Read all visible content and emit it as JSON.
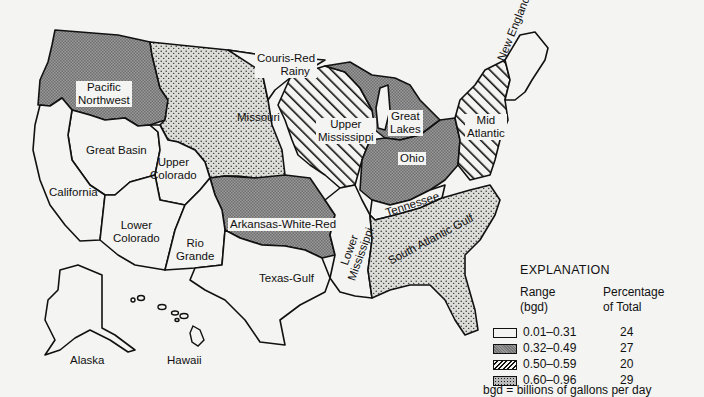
{
  "map": {
    "title": "Water Resources Regions of the United States",
    "regions": [
      {
        "name": "Pacific Northwest",
        "class": "0.32-0.49"
      },
      {
        "name": "Great Basin",
        "class": "0.01-0.31"
      },
      {
        "name": "California",
        "class": "0.01-0.31"
      },
      {
        "name": "Upper Colorado",
        "class": "0.01-0.31"
      },
      {
        "name": "Lower Colorado",
        "class": "0.01-0.31"
      },
      {
        "name": "Rio Grande",
        "class": "0.01-0.31"
      },
      {
        "name": "Texas-Gulf",
        "class": "0.01-0.31"
      },
      {
        "name": "Missouri",
        "class": "0.60-0.96"
      },
      {
        "name": "Couris-Red Rainy",
        "class": "0.01-0.31"
      },
      {
        "name": "Upper Mississippi",
        "class": "0.50-0.59"
      },
      {
        "name": "Great Lakes",
        "class": "0.32-0.49"
      },
      {
        "name": "Ohio",
        "class": "0.32-0.49"
      },
      {
        "name": "Mid Atlantic",
        "class": "0.50-0.59"
      },
      {
        "name": "New England",
        "class": "0.01-0.31"
      },
      {
        "name": "Arkansas-White-Red",
        "class": "0.32-0.49"
      },
      {
        "name": "Lower Mississippi",
        "class": "0.01-0.31"
      },
      {
        "name": "Tennessee",
        "class": "0.01-0.31"
      },
      {
        "name": "South Atlantic Gulf",
        "class": "0.60-0.96"
      },
      {
        "name": "Alaska",
        "class": "0.01-0.31"
      },
      {
        "name": "Hawaii",
        "class": "0.01-0.31"
      }
    ],
    "labels": {
      "pacific_nw_1": "Pacific",
      "pacific_nw_2": "Northwest",
      "great_basin": "Great Basin",
      "california": "California",
      "upper_colorado_1": "Upper",
      "upper_colorado_2": "Colorado",
      "lower_colorado_1": "Lower",
      "lower_colorado_2": "Colorado",
      "rio_grande_1": "Rio",
      "rio_grande_2": "Grande",
      "texas_gulf": "Texas-Gulf",
      "missouri": "Missouri",
      "couris_1": "Couris-Red",
      "couris_2": "Rainy",
      "upper_miss_1": "Upper",
      "upper_miss_2": "Mississippi",
      "great_lakes_1": "Great",
      "great_lakes_2": "Lakes",
      "ohio": "Ohio",
      "mid_atlantic_1": "Mid",
      "mid_atlantic_2": "Atlantic",
      "new_england": "New England",
      "arkansas": "Arkansas-White-Red",
      "lower_miss": "Lower Mississippi",
      "tennessee": "Tennessee",
      "south_atlantic": "South Atlantic Gulf",
      "alaska": "Alaska",
      "hawaii": "Hawaii"
    }
  },
  "legend": {
    "title": "EXPLANATION",
    "col1_header_1": "Range",
    "col1_header_2": "(bgd)",
    "col2_header_1": "Percentage",
    "col2_header_2": "of Total",
    "rows": [
      {
        "range": "0.01–0.31",
        "percent": "24",
        "pattern": "white"
      },
      {
        "range": "0.32–0.49",
        "percent": "27",
        "pattern": "gray"
      },
      {
        "range": "0.50–0.59",
        "percent": "20",
        "pattern": "hatch"
      },
      {
        "range": "0.60–0.96",
        "percent": "29",
        "pattern": "stipple"
      }
    ],
    "note": "bgd = billions of gallons per day"
  },
  "colors": {
    "background": "#f4f4f2",
    "outline": "#111111",
    "gray_fill": "#8a8a8a",
    "stipple_fill": "#c8c8c4"
  }
}
